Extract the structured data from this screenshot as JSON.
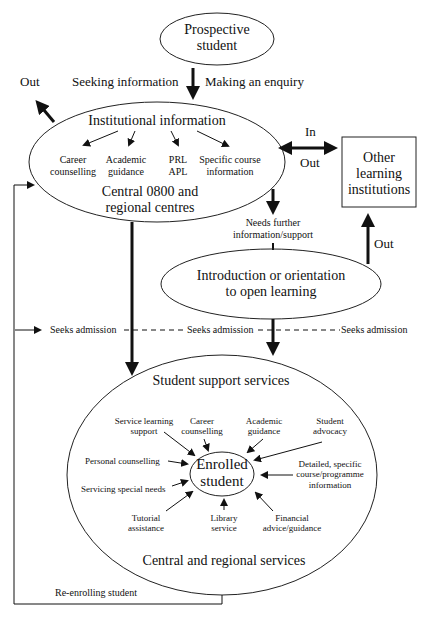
{
  "header": "Prospective student pathway",
  "nodes": {
    "prospective": "Prospective student",
    "prospective_l1": "Prospective",
    "prospective_l2": "student",
    "institutional_title": "Institutional information",
    "inst_items": [
      {
        "l1": "Career",
        "l2": "counselling"
      },
      {
        "l1": "Academic",
        "l2": "guidance"
      },
      {
        "l1": "PRL",
        "l2": "APL"
      },
      {
        "l1": "Specific course",
        "l2": "information"
      }
    ],
    "central_l1": "Central 0800 and",
    "central_l2": "regional centres",
    "other_l1": "Other",
    "other_l2": "learning",
    "other_l3": "institutions",
    "intro_l1": "Introduction or orientation",
    "intro_l2": "to open learning",
    "support_title": "Student support services",
    "enrolled_l1": "Enrolled",
    "enrolled_l2": "student",
    "support_footer": "Central and regional services"
  },
  "support_items": {
    "service_learning_l1": "Service learning",
    "service_learning_l2": "support",
    "career_l1": "Career",
    "career_l2": "counselling",
    "academic_l1": "Academic",
    "academic_l2": "guidance",
    "advocacy_l1": "Student",
    "advocacy_l2": "advocacy",
    "personal": "Personal counselling",
    "special": "Servicing special needs",
    "detailed_l1": "Detailed, specific",
    "detailed_l2": "course/programme",
    "detailed_l3": "information",
    "tutorial_l1": "Tutorial",
    "tutorial_l2": "assistance",
    "library_l1": "Library",
    "library_l2": "service",
    "financial_l1": "Financial",
    "financial_l2": "advice/guidance"
  },
  "edges": {
    "seeking": "Seeking information",
    "enquiry": "Making an enquiry",
    "out_left": "Out",
    "in": "In",
    "out_mid": "Out",
    "out_right": "Out",
    "needs_l1": "Needs further",
    "needs_l2": "information/support",
    "seeks1": "Seeks admission",
    "seeks2": "Seeks admission",
    "seeks3": "Seeks admission",
    "reenroll": "Re-enrolling student"
  }
}
